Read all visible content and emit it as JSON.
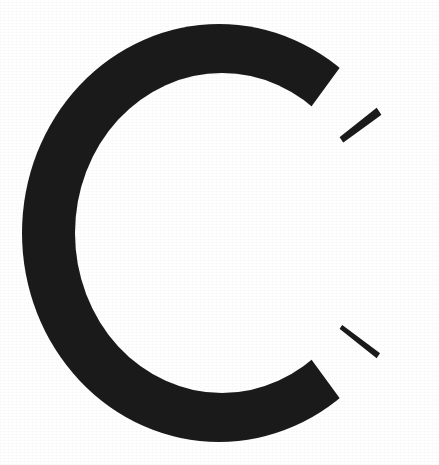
{
  "image": {
    "kind": "letterform-glyph",
    "character": "C",
    "description": "Large uppercase letter C",
    "background_color": "#ffffff",
    "ink_color": "#1a1a1a",
    "canvas": {
      "width": 439,
      "height": 465
    }
  },
  "glyph": {
    "label": "C",
    "name": "letter-c-glyph",
    "style": "sans-serif-capital",
    "bounds": {
      "left": 22,
      "top": 24,
      "right": 413,
      "bottom": 441
    },
    "stroke_width_left": 51,
    "stroke_width_top": 43,
    "aperture_side": "right",
    "aperture_top_y": 122,
    "aperture_bottom_y": 358,
    "terminal_cut": "angled",
    "terminals": [
      {
        "name": "upper-right-terminal",
        "x": 412,
        "y": 98
      },
      {
        "name": "lower-right-terminal",
        "x": 412,
        "y": 366
      }
    ]
  },
  "render": {
    "ring_center_x": 219,
    "ring_center_y": 233,
    "outer_radius_x": 197,
    "outer_radius_y": 209,
    "inner_radius_x": 146,
    "inner_radius_y": 160
  }
}
